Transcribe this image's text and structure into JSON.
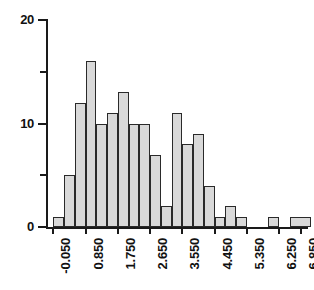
{
  "chart_data": {
    "type": "bar",
    "title": "",
    "xlabel": "",
    "ylabel": "",
    "ylim": [
      0,
      20
    ],
    "xlim": [
      -0.2,
      7.0
    ],
    "grid": false,
    "legend": null,
    "bin_width": 0.3,
    "bar_fill_color": "#d9d9d9",
    "bar_edge_color": "#2a2a2a",
    "axis_color": "#1a1a1a",
    "background_color": "#ffffff",
    "y_ticks": [
      {
        "value": 0,
        "label": "0",
        "major": true
      },
      {
        "value": 5,
        "label": "",
        "major": false
      },
      {
        "value": 10,
        "label": "10",
        "major": true
      },
      {
        "value": 15,
        "label": "",
        "major": false
      },
      {
        "value": 20,
        "label": "20",
        "major": true
      }
    ],
    "x_tick_labels": [
      "-0.050",
      "0.850",
      "1.750",
      "2.650",
      "3.550",
      "4.450",
      "5.350",
      "6.250",
      "6.850"
    ],
    "x_tick_values": [
      -0.05,
      0.85,
      1.75,
      2.65,
      3.55,
      4.45,
      5.35,
      6.25,
      6.85
    ],
    "bins": [
      {
        "left": -0.05,
        "right": 0.25,
        "count": 1
      },
      {
        "left": 0.25,
        "right": 0.55,
        "count": 5
      },
      {
        "left": 0.55,
        "right": 0.85,
        "count": 12
      },
      {
        "left": 0.85,
        "right": 1.15,
        "count": 16
      },
      {
        "left": 1.15,
        "right": 1.45,
        "count": 10
      },
      {
        "left": 1.45,
        "right": 1.75,
        "count": 11
      },
      {
        "left": 1.75,
        "right": 2.05,
        "count": 13
      },
      {
        "left": 2.05,
        "right": 2.35,
        "count": 10
      },
      {
        "left": 2.35,
        "right": 2.65,
        "count": 10
      },
      {
        "left": 2.65,
        "right": 2.95,
        "count": 7
      },
      {
        "left": 2.95,
        "right": 3.25,
        "count": 2
      },
      {
        "left": 3.25,
        "right": 3.55,
        "count": 11
      },
      {
        "left": 3.55,
        "right": 3.85,
        "count": 8
      },
      {
        "left": 3.85,
        "right": 4.15,
        "count": 9
      },
      {
        "left": 4.15,
        "right": 4.45,
        "count": 4
      },
      {
        "left": 4.45,
        "right": 4.75,
        "count": 1
      },
      {
        "left": 4.75,
        "right": 5.05,
        "count": 2
      },
      {
        "left": 5.05,
        "right": 5.35,
        "count": 1
      },
      {
        "left": 5.35,
        "right": 5.65,
        "count": 0
      },
      {
        "left": 5.65,
        "right": 5.95,
        "count": 0
      },
      {
        "left": 5.95,
        "right": 6.25,
        "count": 1
      },
      {
        "left": 6.25,
        "right": 6.55,
        "count": 0
      },
      {
        "left": 6.55,
        "right": 7.15,
        "count": 1
      }
    ]
  }
}
